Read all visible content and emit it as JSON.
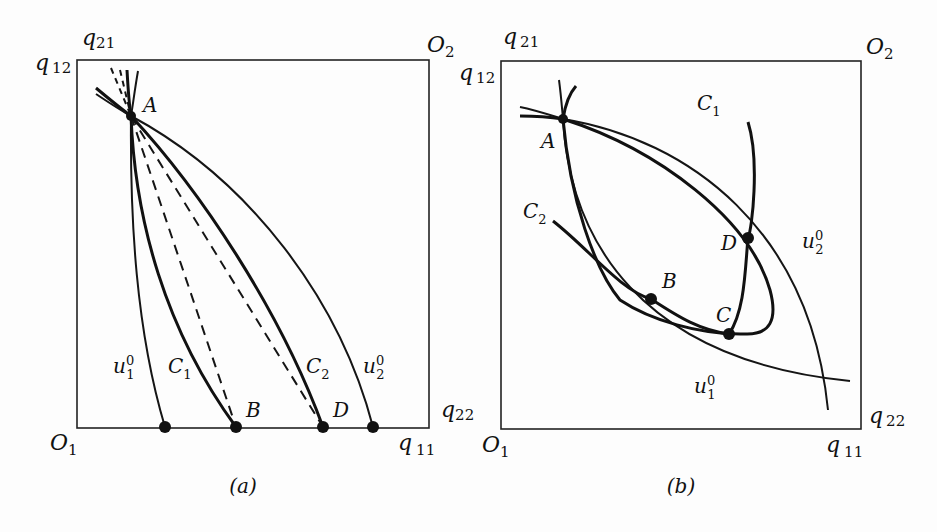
{
  "figure": {
    "panels": [
      {
        "id": "a",
        "caption": "(a)",
        "corner_labels": {
          "top_left_upper": {
            "base": "q",
            "sub": "21"
          },
          "top_left_side": {
            "base": "q",
            "sub": "12"
          },
          "top_right": {
            "base": "O",
            "sub": "2"
          },
          "bottom_left": {
            "base": "O",
            "sub": "1"
          },
          "bottom_right_side": {
            "base": "q",
            "sub": "22"
          },
          "bottom_right_lower": {
            "base": "q",
            "sub": "11"
          }
        },
        "curve_labels": {
          "u1": {
            "base": "u",
            "sub": "1",
            "sup": "0"
          },
          "c1": {
            "base": "C",
            "sub": "1"
          },
          "c2": {
            "base": "C",
            "sub": "2"
          },
          "u2": {
            "base": "u",
            "sub": "2",
            "sup": "0"
          }
        },
        "points": {
          "A": "A",
          "B": "B",
          "D": "D"
        }
      },
      {
        "id": "b",
        "caption": "(b)",
        "corner_labels": {
          "top_left_upper": {
            "base": "q",
            "sub": "21"
          },
          "top_left_side": {
            "base": "q",
            "sub": "12"
          },
          "top_right": {
            "base": "O",
            "sub": "2"
          },
          "bottom_left": {
            "base": "O",
            "sub": "1"
          },
          "bottom_right_side": {
            "base": "q",
            "sub": "22"
          },
          "bottom_right_lower": {
            "base": "q",
            "sub": "11"
          }
        },
        "curve_labels": {
          "c1": {
            "base": "C",
            "sub": "1"
          },
          "c2": {
            "base": "C",
            "sub": "2"
          },
          "u2": {
            "base": "u",
            "sub": "2",
            "sup": "0"
          },
          "u1": {
            "base": "u",
            "sub": "1",
            "sup": "0"
          }
        },
        "points": {
          "A": "A",
          "B": "B",
          "C": "C",
          "D": "D"
        }
      }
    ]
  }
}
